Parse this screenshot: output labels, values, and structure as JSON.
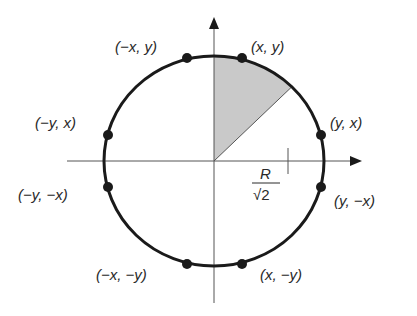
{
  "diagram": {
    "colors": {
      "stroke": "#1a1a1a",
      "axis": "#555555",
      "shade": "#c9c9c9",
      "background": "#ffffff"
    },
    "points": [
      {
        "id": "p-x-y",
        "label": "(x, y)"
      },
      {
        "id": "p-negx-y",
        "label": "(−x, y)"
      },
      {
        "id": "p-y-x",
        "label": "(y, x)"
      },
      {
        "id": "p-negy-x",
        "label": "(−y, x)"
      },
      {
        "id": "p-y-negx",
        "label": "(y, −x)"
      },
      {
        "id": "p-negy-negx",
        "label": "(−y, −x)"
      },
      {
        "id": "p-x-negy",
        "label": "(x, −y)"
      },
      {
        "id": "p-negx-negy",
        "label": "(−x, −y)"
      }
    ],
    "tick_label": {
      "numerator": "R",
      "denominator": "√2"
    },
    "shaded_region": "octant from the positive y-axis to the 45° line"
  }
}
